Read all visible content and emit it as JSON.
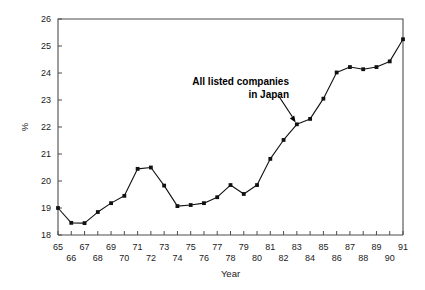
{
  "chart_data": {
    "type": "line",
    "title": "",
    "subtitle": "",
    "xlabel": "Year",
    "ylabel": "%",
    "xlim": [
      65,
      91
    ],
    "ylim": [
      18,
      26
    ],
    "grid": false,
    "legend_position": "none",
    "x_tick_labels": [
      "65",
      "66",
      "67",
      "68",
      "69",
      "70",
      "71",
      "72",
      "73",
      "74",
      "75",
      "76",
      "77",
      "78",
      "79",
      "80",
      "81",
      "82",
      "83",
      "84",
      "85",
      "86",
      "87",
      "88",
      "89",
      "90",
      "91"
    ],
    "y_tick_labels": [
      "18",
      "19",
      "20",
      "21",
      "22",
      "23",
      "24",
      "25",
      "26"
    ],
    "x": [
      65,
      66,
      67,
      68,
      69,
      70,
      71,
      72,
      73,
      74,
      75,
      76,
      77,
      78,
      79,
      80,
      81,
      82,
      83,
      84,
      85,
      86,
      87,
      88,
      89,
      90,
      91
    ],
    "series": [
      {
        "name": "All listed companies in Japan",
        "marker": "square",
        "values": [
          19.0,
          18.45,
          18.44,
          18.85,
          19.18,
          19.45,
          20.45,
          20.5,
          19.83,
          19.07,
          19.11,
          19.18,
          19.4,
          19.85,
          19.52,
          19.85,
          20.82,
          21.52,
          22.1,
          22.3,
          23.05,
          24.02,
          24.22,
          24.14,
          24.22,
          24.43,
          25.25
        ]
      }
    ],
    "annotations": [
      {
        "text_line1": "All listed companies",
        "text_line2": "in Japan",
        "points_to_x": 83,
        "points_to_y": 22.1
      }
    ]
  },
  "colors": {
    "line": "#111111",
    "marker": "#111111",
    "axis": "#4d4d4d",
    "text": "#1a1a1a",
    "background": "#ffffff"
  }
}
